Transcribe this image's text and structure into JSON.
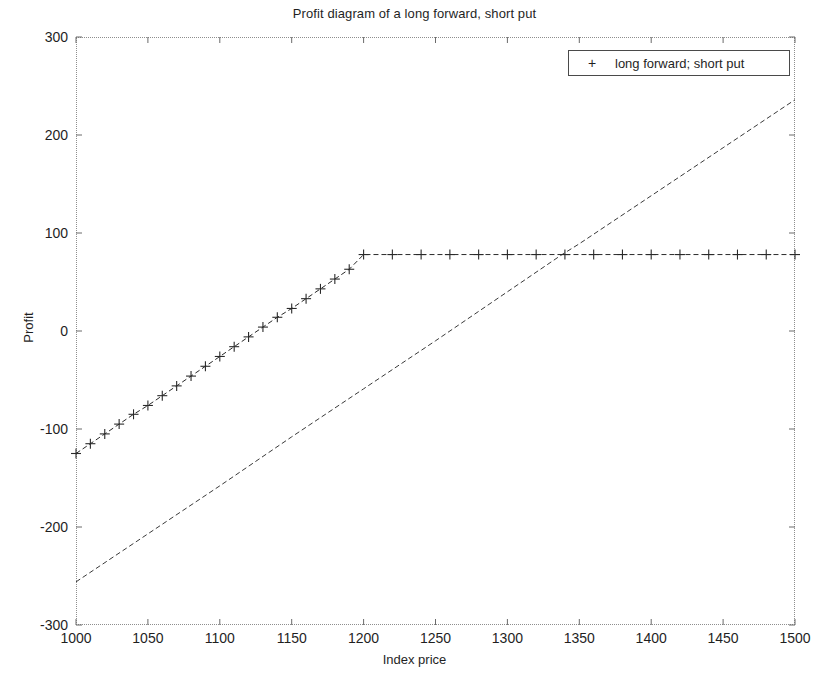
{
  "chart_data": {
    "type": "line",
    "title": "Profit diagram of a long forward, short put",
    "xlabel": "Index price",
    "ylabel": "Profit",
    "xlim": [
      1000,
      1500
    ],
    "ylim": [
      -300,
      300
    ],
    "xticks": [
      1000,
      1050,
      1100,
      1150,
      1200,
      1250,
      1300,
      1350,
      1400,
      1450,
      1500
    ],
    "yticks": [
      300,
      200,
      100,
      0,
      -100,
      -200,
      -300
    ],
    "grid": false,
    "frame": true,
    "legend_position": "upper right",
    "legend": [
      "long forward; short put"
    ],
    "series": [
      {
        "name": "long forward",
        "style": "dashed",
        "marker": "none",
        "color": "#3a3a3a",
        "in_legend": false,
        "x": [
          1000,
          1050,
          1100,
          1150,
          1200,
          1250,
          1300,
          1338,
          1350,
          1400,
          1450,
          1500
        ],
        "values": [
          -256,
          -207,
          -158,
          -108,
          -59,
          -10,
          40,
          78,
          89,
          138,
          187,
          236
        ]
      },
      {
        "name": "long forward; short put",
        "style": "dashed",
        "marker": "+",
        "color": "#2a2a2a",
        "in_legend": true,
        "strike": 1200,
        "plateau": 78,
        "x": [
          1000,
          1010,
          1020,
          1030,
          1040,
          1050,
          1060,
          1070,
          1080,
          1090,
          1100,
          1110,
          1120,
          1130,
          1140,
          1150,
          1160,
          1170,
          1180,
          1190,
          1200,
          1220,
          1240,
          1260,
          1280,
          1300,
          1320,
          1340,
          1360,
          1380,
          1400,
          1420,
          1440,
          1460,
          1480,
          1500
        ],
        "values": [
          -125,
          -115,
          -105,
          -95,
          -85,
          -76,
          -66,
          -56,
          -46,
          -36,
          -26,
          -16,
          -6,
          4,
          14,
          23,
          33,
          43,
          53,
          63,
          78,
          78,
          78,
          78,
          78,
          78,
          78,
          78,
          78,
          78,
          78,
          78,
          78,
          78,
          78,
          78
        ]
      }
    ],
    "annotations": {
      "crossover_x": 1338,
      "crossover_y": 78
    }
  },
  "legend": {
    "marker_glyph": "+",
    "entry_label": "long forward; short put"
  }
}
